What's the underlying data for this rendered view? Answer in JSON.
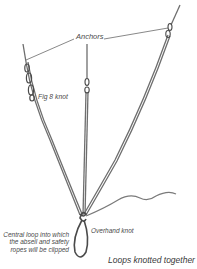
{
  "diagram": {
    "labels": {
      "anchors": "Anchors",
      "fig8": "Fig 8 knot",
      "overhand": "Overhand knot",
      "central_loop": "Central loop into which the abseil and safety ropes will be clipped",
      "loops_knotted": "Loops knotted together"
    },
    "colors": {
      "rope": "#6e6e6e",
      "rope_dark": "#4a4a4a",
      "leader_line": "#555555",
      "text": "#4a4a4a",
      "background": "#ffffff"
    },
    "elements": [
      "left-anchor",
      "center-anchor",
      "right-anchor",
      "fig8-knot",
      "overhand-knot",
      "central-loop",
      "loose-rope-tail"
    ]
  }
}
